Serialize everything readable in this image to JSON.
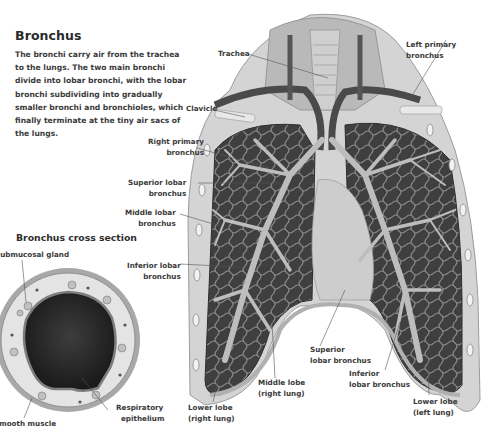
{
  "header": {
    "title": "Bronchus",
    "intro": "The bronchi carry air from the trachea to the lungs. The two main bronchi divide into lobar bronchi, with the lobar bronchi subdividing into gradually smaller bronchi and bronchioles, which finally terminate at the tiny air sacs of the lungs."
  },
  "cross_section": {
    "title": "Bronchus cross section",
    "labels": {
      "submucosal_gland": "Submucosal gland",
      "smooth_muscle": "Smooth muscle",
      "respiratory_epithelium": [
        "Respiratory",
        "epithelium"
      ]
    }
  },
  "lungs": {
    "labels": {
      "trachea": "Trachea",
      "left_primary_bronchus": [
        "Left primary",
        "bronchus"
      ],
      "clavicle": "Clavicle",
      "right_primary_bronchus": [
        "Right primary",
        "bronchus"
      ],
      "superior_lobar_bronchus_right": [
        "Superior lobar",
        "bronchus"
      ],
      "middle_lobar_bronchus": [
        "Middle lobar",
        "bronchus"
      ],
      "inferior_lobar_bronchus_right": [
        "Inferior lobar",
        "bronchus"
      ],
      "superior_lobar_bronchus_left": [
        "Superior",
        "lobar bronchus"
      ],
      "inferior_lobar_bronchus_left": [
        "Inferior",
        "lobar bronchus"
      ],
      "middle_lobe_right": [
        "Middle lobe",
        "(right lung)"
      ],
      "lower_lobe_right": [
        "Lower lobe",
        "(right lung)"
      ],
      "lower_lobe_left": [
        "Lower lobe",
        "(left lung)"
      ]
    }
  },
  "colors": {
    "text": "#3a3a3a",
    "lung_dark": "#4a4a4a",
    "airway_light": "#bdbdbd",
    "leader_line": "#555555"
  }
}
